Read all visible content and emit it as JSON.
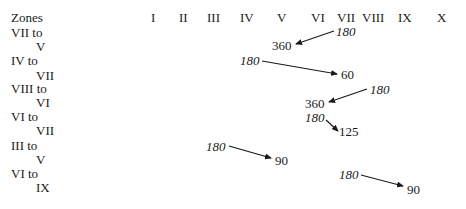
{
  "figure": {
    "header_label": "Zones",
    "columns": [
      "I",
      "II",
      "III",
      "IV",
      "V",
      "VI",
      "VII",
      "VIII",
      "IX",
      "X"
    ],
    "rows": [
      {
        "from_label": "VII to",
        "to_label": "V",
        "start_value": "180",
        "end_value": "360"
      },
      {
        "from_label": "IV to",
        "to_label": "VII",
        "start_value": "180",
        "end_value": "60"
      },
      {
        "from_label": "VIII to",
        "to_label": "VI",
        "start_value": "180",
        "end_value": "360"
      },
      {
        "from_label": "VI to",
        "to_label": "VII",
        "start_value": "180",
        "end_value": "125"
      },
      {
        "from_label": "III to",
        "to_label": "V",
        "start_value": "180",
        "end_value": "90"
      },
      {
        "from_label": "VI to",
        "to_label": "IX",
        "start_value": "180",
        "end_value": "90"
      }
    ]
  },
  "caption": {
    "text": "Zone transitions from the starting value to the resulting value (text cut off)"
  }
}
